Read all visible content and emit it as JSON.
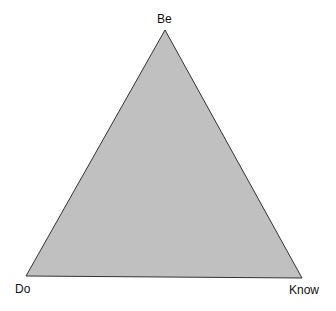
{
  "diagram": {
    "type": "triangle",
    "fill_color": "#c0c0c0",
    "stroke_color": "#333333",
    "vertices": {
      "top": {
        "label": "Be"
      },
      "bottom_left": {
        "label": "Do"
      },
      "bottom_right": {
        "label": "Know"
      }
    }
  }
}
